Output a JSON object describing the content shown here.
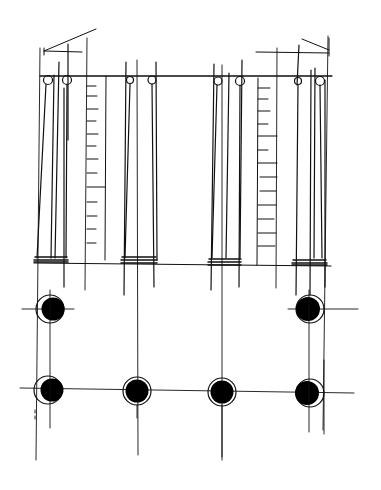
{
  "drawing": {
    "type": "architectural sketch",
    "views": [
      "elevation",
      "plan"
    ],
    "ink_color": "#111111",
    "paper_color": "#ffffff"
  },
  "elevation": {
    "entablature_y": 76,
    "stylobate_y": 264,
    "columns": [
      {
        "name": "column-1",
        "left": 40,
        "right": 68,
        "volutes": [
          47,
          64
        ]
      },
      {
        "name": "column-2",
        "left": 124,
        "right": 155,
        "volutes": [
          130,
          152
        ]
      },
      {
        "name": "column-3",
        "left": 212,
        "right": 241,
        "volutes": [
          219,
          240
        ]
      },
      {
        "name": "column-4",
        "left": 294,
        "right": 325,
        "volutes": [
          300,
          320
        ]
      }
    ],
    "door_panels": [
      {
        "name": "left-panel",
        "left": 86,
        "right": 106,
        "ticks": 12
      },
      {
        "name": "right-panel",
        "left": 258,
        "right": 278,
        "ticks": 12
      }
    ]
  },
  "plan": {
    "rows": [
      {
        "y": 309,
        "columns_x": [
          50,
          309
        ]
      },
      {
        "y": 390,
        "columns_x": [
          50,
          137,
          222,
          308
        ]
      }
    ]
  }
}
